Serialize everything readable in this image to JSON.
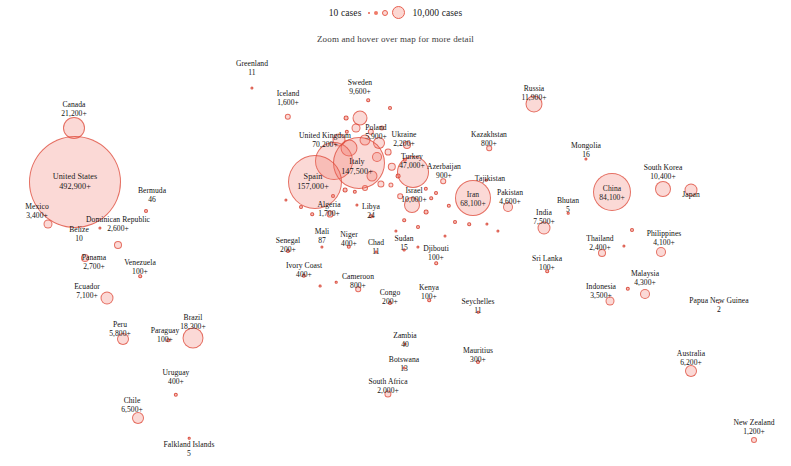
{
  "legend": {
    "min_label": "10 cases",
    "max_label": "10,000 cases"
  },
  "subtitle": "Zoom and hover over map for more detail",
  "chart_data": {
    "type": "scatter",
    "title": "",
    "subtitle": "Zoom and hover over map for more detail",
    "xlabel": "",
    "ylabel": "",
    "value_unit": "cases",
    "size_legend": {
      "min_value": 10,
      "max_value": 10000
    },
    "bubble_color": "#ee6a58",
    "points": [
      {
        "name": "Canada",
        "value": "21,200+",
        "x": 74,
        "y": 128,
        "r": 11,
        "label_x": 74,
        "label_y": 100,
        "inside": false
      },
      {
        "name": "United States",
        "value": "492,900+",
        "x": 75,
        "y": 182,
        "r": 46,
        "label_x": 75,
        "label_y": 172,
        "inside": true,
        "big": true
      },
      {
        "name": "Bermuda",
        "value": "46",
        "x": 146,
        "y": 211,
        "r": 2,
        "label_x": 152,
        "label_y": 186,
        "inside": false
      },
      {
        "name": "Mexico",
        "value": "3,400+",
        "x": 48,
        "y": 224,
        "r": 4.5,
        "label_x": 37,
        "label_y": 202,
        "inside": false
      },
      {
        "name": "Belize",
        "value": "10",
        "x": 100,
        "y": 228,
        "r": 1.6,
        "label_x": 79,
        "label_y": 225,
        "inside": false
      },
      {
        "name": "Dominican Republic",
        "value": "2,600+",
        "x": 118,
        "y": 245,
        "r": 4,
        "label_x": 118,
        "label_y": 215,
        "inside": false
      },
      {
        "name": "Panama",
        "value": "2,700+",
        "x": 85,
        "y": 258,
        "r": 4,
        "label_x": 94,
        "label_y": 253,
        "inside": false
      },
      {
        "name": "Venezuela",
        "value": "100+",
        "x": 140,
        "y": 276,
        "r": 1.8,
        "label_x": 140,
        "label_y": 258,
        "inside": false
      },
      {
        "name": "Ecuador",
        "value": "7,100+",
        "x": 107,
        "y": 298,
        "r": 6.5,
        "label_x": 87,
        "label_y": 282,
        "inside": false
      },
      {
        "name": "Peru",
        "value": "5,800+",
        "x": 123,
        "y": 339,
        "r": 6,
        "label_x": 120,
        "label_y": 320,
        "inside": false
      },
      {
        "name": "Brazil",
        "value": "18,300+",
        "x": 193,
        "y": 338,
        "r": 10.5,
        "label_x": 193,
        "label_y": 313,
        "inside": false
      },
      {
        "name": "Paraguay",
        "value": "100+",
        "x": 168,
        "y": 340,
        "r": 1.8,
        "label_x": 165,
        "label_y": 326,
        "inside": false
      },
      {
        "name": "Uruguay",
        "value": "400+",
        "x": 176,
        "y": 395,
        "r": 2.2,
        "label_x": 176,
        "label_y": 368,
        "inside": false
      },
      {
        "name": "Chile",
        "value": "6,500+",
        "x": 138,
        "y": 418,
        "r": 6,
        "label_x": 132,
        "label_y": 396,
        "inside": false
      },
      {
        "name": "Falkland Islands",
        "value": "5",
        "x": 189,
        "y": 438,
        "r": 1.3,
        "label_x": 189,
        "label_y": 440,
        "inside": false
      },
      {
        "name": "Greenland",
        "value": "11",
        "x": 252,
        "y": 88,
        "r": 1.6,
        "label_x": 252,
        "label_y": 59,
        "inside": false
      },
      {
        "name": "Iceland",
        "value": "1,600+",
        "x": 288,
        "y": 117,
        "r": 3.2,
        "label_x": 288,
        "label_y": 89,
        "inside": false
      },
      {
        "name": "Sweden",
        "value": "9,600+",
        "x": 360,
        "y": 118,
        "r": 7.5,
        "label_x": 360,
        "label_y": 78,
        "inside": false
      },
      {
        "name": "United Kingdom",
        "value": "70,200+",
        "x": 334,
        "y": 161,
        "r": 19,
        "label_x": 325,
        "label_y": 131,
        "inside": false
      },
      {
        "name": "Poland",
        "value": "5,900+",
        "x": 379,
        "y": 143,
        "r": 6,
        "label_x": 376,
        "label_y": 123,
        "inside": false
      },
      {
        "name": "Ukraine",
        "value": "2,200+",
        "x": 407,
        "y": 145,
        "r": 4,
        "label_x": 404,
        "label_y": 130,
        "inside": false
      },
      {
        "name": "Italy",
        "value": "147,500+",
        "x": 359,
        "y": 163,
        "r": 26,
        "label_x": 357,
        "label_y": 157,
        "inside": true,
        "big": true
      },
      {
        "name": "Spain",
        "value": "157,000+",
        "x": 315,
        "y": 182,
        "r": 27,
        "label_x": 313,
        "label_y": 172,
        "inside": true,
        "big": true
      },
      {
        "name": "Turkey",
        "value": "47,000+",
        "x": 413,
        "y": 172,
        "r": 16,
        "label_x": 412,
        "label_y": 152,
        "inside": false
      },
      {
        "name": "Algeria",
        "value": "1,700+",
        "x": 330,
        "y": 214,
        "r": 3.4,
        "label_x": 329,
        "label_y": 200,
        "inside": false
      },
      {
        "name": "Libya",
        "value": "24",
        "x": 371,
        "y": 216,
        "r": 1.8,
        "label_x": 371,
        "label_y": 202,
        "inside": false
      },
      {
        "name": "Azerbaijan",
        "value": "900+",
        "x": 443,
        "y": 181,
        "r": 2.8,
        "label_x": 444,
        "label_y": 162,
        "inside": false
      },
      {
        "name": "Israel",
        "value": "10,000+",
        "x": 412,
        "y": 205,
        "r": 8,
        "label_x": 414,
        "label_y": 186,
        "inside": false
      },
      {
        "name": "Kazakhstan",
        "value": "800+",
        "x": 489,
        "y": 148,
        "r": 2.8,
        "label_x": 489,
        "label_y": 130,
        "inside": false
      },
      {
        "name": "Tajikistan",
        "value": "",
        "x": 486,
        "y": 180,
        "r": 1.3,
        "label_x": 490,
        "label_y": 174,
        "inside": false
      },
      {
        "name": "Russia",
        "value": "11,900+",
        "x": 534,
        "y": 104,
        "r": 8.5,
        "label_x": 534,
        "label_y": 84,
        "inside": false
      },
      {
        "name": "Iran",
        "value": "68,100+",
        "x": 473,
        "y": 198,
        "r": 18,
        "label_x": 473,
        "label_y": 190,
        "inside": true
      },
      {
        "name": "Pakistan",
        "value": "4,600+",
        "x": 508,
        "y": 207,
        "r": 5,
        "label_x": 510,
        "label_y": 188,
        "inside": false
      },
      {
        "name": "India",
        "value": "7,500+",
        "x": 544,
        "y": 228,
        "r": 6.5,
        "label_x": 544,
        "label_y": 208,
        "inside": false
      },
      {
        "name": "Bhutan",
        "value": "5",
        "x": 568,
        "y": 213,
        "r": 1.3,
        "label_x": 568,
        "label_y": 196,
        "inside": false
      },
      {
        "name": "Mongolia",
        "value": "16",
        "x": 586,
        "y": 159,
        "r": 1.6,
        "label_x": 586,
        "label_y": 141,
        "inside": false
      },
      {
        "name": "China",
        "value": "84,100+",
        "x": 612,
        "y": 192,
        "r": 19,
        "label_x": 612,
        "label_y": 184,
        "inside": true
      },
      {
        "name": "South Korea",
        "value": "10,400+",
        "x": 663,
        "y": 189,
        "r": 8,
        "label_x": 663,
        "label_y": 163,
        "inside": false
      },
      {
        "name": "Japan",
        "value": "",
        "x": 691,
        "y": 190,
        "r": 6.5,
        "label_x": 691,
        "label_y": 190,
        "inside": false
      },
      {
        "name": "Thailand",
        "value": "2,400+",
        "x": 602,
        "y": 253,
        "r": 4,
        "label_x": 600,
        "label_y": 234,
        "inside": false
      },
      {
        "name": "Philippines",
        "value": "4,100+",
        "x": 661,
        "y": 252,
        "r": 5,
        "label_x": 664,
        "label_y": 229,
        "inside": false
      },
      {
        "name": "Sri Lanka",
        "value": "100+",
        "x": 547,
        "y": 271,
        "r": 1.8,
        "label_x": 547,
        "label_y": 254,
        "inside": false
      },
      {
        "name": "Indonesia",
        "value": "3,500+",
        "x": 610,
        "y": 301,
        "r": 4.5,
        "label_x": 601,
        "label_y": 282,
        "inside": false
      },
      {
        "name": "Malaysia",
        "value": "4,300+",
        "x": 645,
        "y": 294,
        "r": 5,
        "label_x": 645,
        "label_y": 269,
        "inside": false
      },
      {
        "name": "Papua New Guinea",
        "value": "2",
        "x": 719,
        "y": 303,
        "r": 1.2,
        "label_x": 719,
        "label_y": 296,
        "inside": false
      },
      {
        "name": "Australia",
        "value": "6,200+",
        "x": 691,
        "y": 371,
        "r": 6,
        "label_x": 691,
        "label_y": 349,
        "inside": false
      },
      {
        "name": "New Zealand",
        "value": "1,200+",
        "x": 754,
        "y": 440,
        "r": 3,
        "label_x": 754,
        "label_y": 418,
        "inside": false
      },
      {
        "name": "Senegal",
        "value": "200+",
        "x": 288,
        "y": 251,
        "r": 2,
        "label_x": 288,
        "label_y": 236,
        "inside": false
      },
      {
        "name": "Mali",
        "value": "87",
        "x": 322,
        "y": 247,
        "r": 1.6,
        "label_x": 322,
        "label_y": 227,
        "inside": false
      },
      {
        "name": "Niger",
        "value": "400+",
        "x": 349,
        "y": 247,
        "r": 2.2,
        "label_x": 349,
        "label_y": 230,
        "inside": false
      },
      {
        "name": "Chad",
        "value": "11",
        "x": 376,
        "y": 252,
        "r": 1.4,
        "label_x": 376,
        "label_y": 238,
        "inside": false
      },
      {
        "name": "Sudan",
        "value": "15",
        "x": 404,
        "y": 250,
        "r": 1.4,
        "label_x": 404,
        "label_y": 234,
        "inside": false
      },
      {
        "name": "Ivory Coast",
        "value": "400+",
        "x": 304,
        "y": 276,
        "r": 2.2,
        "label_x": 304,
        "label_y": 261,
        "inside": false
      },
      {
        "name": "Cameroon",
        "value": "800+",
        "x": 358,
        "y": 289,
        "r": 2.8,
        "label_x": 358,
        "label_y": 272,
        "inside": false
      },
      {
        "name": "Djibouti",
        "value": "100+",
        "x": 436,
        "y": 263,
        "r": 1.8,
        "label_x": 436,
        "label_y": 244,
        "inside": false
      },
      {
        "name": "Congo",
        "value": "200+",
        "x": 390,
        "y": 303,
        "r": 2,
        "label_x": 390,
        "label_y": 288,
        "inside": false
      },
      {
        "name": "Kenya",
        "value": "100+",
        "x": 429,
        "y": 300,
        "r": 1.8,
        "label_x": 429,
        "label_y": 283,
        "inside": false
      },
      {
        "name": "Seychelles",
        "value": "11",
        "x": 478,
        "y": 312,
        "r": 1.3,
        "label_x": 478,
        "label_y": 297,
        "inside": false
      },
      {
        "name": "Zambia",
        "value": "40",
        "x": 405,
        "y": 344,
        "r": 1.5,
        "label_x": 405,
        "label_y": 331,
        "inside": false
      },
      {
        "name": "Botswana",
        "value": "13",
        "x": 404,
        "y": 368,
        "r": 1.4,
        "label_x": 404,
        "label_y": 355,
        "inside": false
      },
      {
        "name": "Mauritius",
        "value": "300+",
        "x": 478,
        "y": 362,
        "r": 2,
        "label_x": 478,
        "label_y": 346,
        "inside": false
      },
      {
        "name": "South Africa",
        "value": "2,000+",
        "x": 388,
        "y": 394,
        "r": 3.6,
        "label_x": 388,
        "label_y": 377,
        "inside": false
      }
    ],
    "extra_markers": [
      {
        "x": 347,
        "y": 132,
        "r": 2.2
      },
      {
        "x": 356,
        "y": 128,
        "r": 4.5
      },
      {
        "x": 371,
        "y": 132,
        "r": 3.2
      },
      {
        "x": 382,
        "y": 128,
        "r": 2.6
      },
      {
        "x": 339,
        "y": 140,
        "r": 6.5
      },
      {
        "x": 349,
        "y": 148,
        "r": 8.5
      },
      {
        "x": 365,
        "y": 140,
        "r": 5.5
      },
      {
        "x": 377,
        "y": 157,
        "r": 5.0
      },
      {
        "x": 388,
        "y": 152,
        "r": 3.4
      },
      {
        "x": 392,
        "y": 167,
        "r": 4.2
      },
      {
        "x": 372,
        "y": 176,
        "r": 5.5
      },
      {
        "x": 381,
        "y": 184,
        "r": 3.6
      },
      {
        "x": 391,
        "y": 185,
        "r": 2.6
      },
      {
        "x": 365,
        "y": 188,
        "r": 3.0
      },
      {
        "x": 355,
        "y": 192,
        "r": 2.2
      },
      {
        "x": 345,
        "y": 190,
        "r": 2.4
      },
      {
        "x": 333,
        "y": 196,
        "r": 2.0
      },
      {
        "x": 398,
        "y": 176,
        "r": 2.4
      },
      {
        "x": 405,
        "y": 160,
        "r": 2.2
      },
      {
        "x": 400,
        "y": 196,
        "r": 2.8
      },
      {
        "x": 426,
        "y": 189,
        "r": 2.2
      },
      {
        "x": 436,
        "y": 193,
        "r": 2.0
      },
      {
        "x": 431,
        "y": 198,
        "r": 1.8
      },
      {
        "x": 449,
        "y": 206,
        "r": 2.2
      },
      {
        "x": 426,
        "y": 212,
        "r": 2.4
      },
      {
        "x": 404,
        "y": 220,
        "r": 1.8
      },
      {
        "x": 418,
        "y": 227,
        "r": 2.0
      },
      {
        "x": 396,
        "y": 231,
        "r": 1.6
      },
      {
        "x": 455,
        "y": 222,
        "r": 2.0
      },
      {
        "x": 469,
        "y": 224,
        "r": 1.8
      },
      {
        "x": 487,
        "y": 224,
        "r": 1.6
      },
      {
        "x": 498,
        "y": 231,
        "r": 1.6
      },
      {
        "x": 312,
        "y": 214,
        "r": 1.8
      },
      {
        "x": 301,
        "y": 207,
        "r": 2.0
      },
      {
        "x": 286,
        "y": 200,
        "r": 1.6
      },
      {
        "x": 357,
        "y": 205,
        "r": 1.6
      },
      {
        "x": 418,
        "y": 247,
        "r": 1.6
      },
      {
        "x": 445,
        "y": 236,
        "r": 1.5
      },
      {
        "x": 320,
        "y": 286,
        "r": 1.4
      },
      {
        "x": 336,
        "y": 282,
        "r": 1.3
      },
      {
        "x": 632,
        "y": 230,
        "r": 2.0
      },
      {
        "x": 624,
        "y": 246,
        "r": 1.6
      },
      {
        "x": 628,
        "y": 289,
        "r": 2.2
      },
      {
        "x": 346,
        "y": 118,
        "r": 2.4
      },
      {
        "x": 390,
        "y": 108,
        "r": 2.0
      },
      {
        "x": 368,
        "y": 100,
        "r": 1.8
      }
    ]
  }
}
